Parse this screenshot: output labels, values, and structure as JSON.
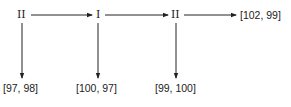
{
  "diagram": {
    "type": "game-tree-path",
    "nodes": [
      {
        "id": "n1",
        "label": "II"
      },
      {
        "id": "n2",
        "label": "I"
      },
      {
        "id": "n3",
        "label": "II"
      }
    ],
    "payoffs": [
      {
        "id": "p1",
        "label": "[97, 98]"
      },
      {
        "id": "p2",
        "label": "[100, 97]"
      },
      {
        "id": "p3",
        "label": "[99, 100]"
      },
      {
        "id": "p4",
        "label": "[102, 99]"
      }
    ],
    "edges": [
      {
        "from": "n1",
        "to": "n2",
        "direction": "right"
      },
      {
        "from": "n2",
        "to": "n3",
        "direction": "right"
      },
      {
        "from": "n3",
        "to": "p4",
        "direction": "right"
      },
      {
        "from": "n1",
        "to": "p1",
        "direction": "down"
      },
      {
        "from": "n2",
        "to": "p2",
        "direction": "down"
      },
      {
        "from": "n3",
        "to": "p3",
        "direction": "down"
      }
    ]
  }
}
